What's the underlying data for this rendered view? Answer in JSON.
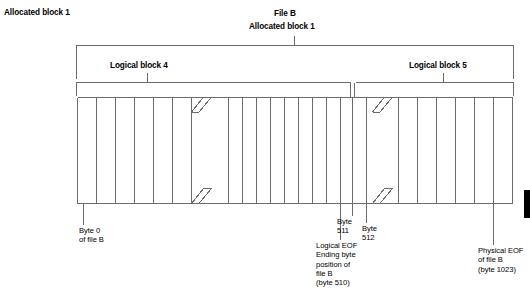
{
  "figure": {
    "title_top_left": "Allocated block 1",
    "file_title": "File B",
    "file_subtitle": "Allocated block 1",
    "bracket_labels": {
      "logical_block_left": "Logical block 4",
      "logical_block_right": "Logical block 5"
    },
    "callouts": {
      "byte0": "Byte 0\nof file B",
      "byte511": "Byte\n511",
      "byte512": "Byte\n512",
      "logical_eof": "Logical EOF\nEnding byte\nposition of\nfile B\n(byte 510)",
      "physical_eof": "Physical EOF\nof file B\n(byte 1023)"
    },
    "colors": {
      "line": "#6b6b6b",
      "text": "#000000",
      "marker": "#000000",
      "background": "#ffffff"
    }
  }
}
